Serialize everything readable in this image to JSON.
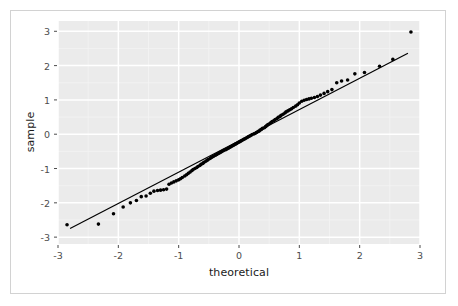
{
  "figure": {
    "width": 458,
    "height": 306,
    "background": "#ffffff",
    "frame_color": "#d2d2d2"
  },
  "chart_data": {
    "type": "scatter",
    "title": "",
    "subtitle": "",
    "xlabel": "theoretical",
    "ylabel": "sample",
    "xlim": [
      -3.0,
      3.0
    ],
    "ylim": [
      -3.2,
      3.3
    ],
    "xticks": [
      -3,
      -2,
      -1,
      0,
      1,
      2,
      3
    ],
    "xticklabels": [
      "-3",
      "-2",
      "-1",
      "0",
      "1",
      "2",
      "3"
    ],
    "yticks": [
      -3,
      -2,
      -1,
      0,
      1,
      2,
      3
    ],
    "yticklabels": [
      "-3",
      "-2",
      "-1",
      "0",
      "1",
      "2",
      "3"
    ],
    "grid": true,
    "grid_major_color": "#ffffff",
    "grid_minor_color": "#f4f4f4",
    "panel_background": "#ebebeb",
    "legend": null,
    "legend_position": "none",
    "point_color": "#000000",
    "point_size": 3.6,
    "line_color": "#000000",
    "line_width": 1.2,
    "reference_line": {
      "label": "qq reference line",
      "x": [
        -2.8,
        2.8
      ],
      "y": [
        -2.75,
        2.36
      ],
      "slope": 0.912,
      "intercept": -0.196
    },
    "series": [
      {
        "name": "sample quantiles",
        "points": [
          [
            -2.85,
            -2.64
          ],
          [
            -2.33,
            -2.62
          ],
          [
            -2.08,
            -2.32
          ],
          [
            -1.92,
            -2.12
          ],
          [
            -1.8,
            -2.0
          ],
          [
            -1.7,
            -1.93
          ],
          [
            -1.62,
            -1.82
          ],
          [
            -1.54,
            -1.8
          ],
          [
            -1.47,
            -1.72
          ],
          [
            -1.41,
            -1.66
          ],
          [
            -1.35,
            -1.64
          ],
          [
            -1.3,
            -1.63
          ],
          [
            -1.25,
            -1.62
          ],
          [
            -1.2,
            -1.6
          ],
          [
            -1.16,
            -1.46
          ],
          [
            -1.12,
            -1.42
          ],
          [
            -1.08,
            -1.39
          ],
          [
            -1.04,
            -1.36
          ],
          [
            -1.0,
            -1.33
          ],
          [
            -0.97,
            -1.3
          ],
          [
            -0.94,
            -1.26
          ],
          [
            -0.9,
            -1.22
          ],
          [
            -0.87,
            -1.18
          ],
          [
            -0.84,
            -1.14
          ],
          [
            -0.81,
            -1.1
          ],
          [
            -0.78,
            -1.06
          ],
          [
            -0.76,
            -1.03
          ],
          [
            -0.73,
            -1.0
          ],
          [
            -0.7,
            -0.97
          ],
          [
            -0.68,
            -0.94
          ],
          [
            -0.65,
            -0.91
          ],
          [
            -0.63,
            -0.88
          ],
          [
            -0.6,
            -0.85
          ],
          [
            -0.58,
            -0.82
          ],
          [
            -0.55,
            -0.79
          ],
          [
            -0.53,
            -0.76
          ],
          [
            -0.51,
            -0.74
          ],
          [
            -0.48,
            -0.71
          ],
          [
            -0.46,
            -0.68
          ],
          [
            -0.44,
            -0.66
          ],
          [
            -0.42,
            -0.64
          ],
          [
            -0.39,
            -0.61
          ],
          [
            -0.37,
            -0.59
          ],
          [
            -0.35,
            -0.57
          ],
          [
            -0.33,
            -0.55
          ],
          [
            -0.31,
            -0.53
          ],
          [
            -0.29,
            -0.51
          ],
          [
            -0.27,
            -0.49
          ],
          [
            -0.25,
            -0.47
          ],
          [
            -0.22,
            -0.45
          ],
          [
            -0.2,
            -0.43
          ],
          [
            -0.18,
            -0.41
          ],
          [
            -0.16,
            -0.39
          ],
          [
            -0.14,
            -0.37
          ],
          [
            -0.12,
            -0.35
          ],
          [
            -0.1,
            -0.33
          ],
          [
            -0.08,
            -0.31
          ],
          [
            -0.06,
            -0.29
          ],
          [
            -0.04,
            -0.27
          ],
          [
            -0.02,
            -0.25
          ],
          [
            0.0,
            -0.23
          ],
          [
            0.02,
            -0.21
          ],
          [
            0.04,
            -0.19
          ],
          [
            0.06,
            -0.17
          ],
          [
            0.08,
            -0.15
          ],
          [
            0.1,
            -0.13
          ],
          [
            0.12,
            -0.11
          ],
          [
            0.14,
            -0.09
          ],
          [
            0.16,
            -0.07
          ],
          [
            0.18,
            -0.05
          ],
          [
            0.2,
            -0.03
          ],
          [
            0.22,
            -0.01
          ],
          [
            0.25,
            0.01
          ],
          [
            0.27,
            0.03
          ],
          [
            0.29,
            0.05
          ],
          [
            0.31,
            0.07
          ],
          [
            0.33,
            0.09
          ],
          [
            0.35,
            0.12
          ],
          [
            0.37,
            0.14
          ],
          [
            0.39,
            0.17
          ],
          [
            0.42,
            0.19
          ],
          [
            0.44,
            0.22
          ],
          [
            0.46,
            0.25
          ],
          [
            0.48,
            0.28
          ],
          [
            0.51,
            0.31
          ],
          [
            0.53,
            0.34
          ],
          [
            0.55,
            0.37
          ],
          [
            0.58,
            0.4
          ],
          [
            0.6,
            0.43
          ],
          [
            0.63,
            0.46
          ],
          [
            0.65,
            0.49
          ],
          [
            0.68,
            0.52
          ],
          [
            0.7,
            0.55
          ],
          [
            0.73,
            0.58
          ],
          [
            0.76,
            0.62
          ],
          [
            0.78,
            0.65
          ],
          [
            0.81,
            0.68
          ],
          [
            0.84,
            0.71
          ],
          [
            0.87,
            0.74
          ],
          [
            0.9,
            0.78
          ],
          [
            0.94,
            0.82
          ],
          [
            0.97,
            0.86
          ],
          [
            1.0,
            0.91
          ],
          [
            1.04,
            0.96
          ],
          [
            1.08,
            0.99
          ],
          [
            1.12,
            1.01
          ],
          [
            1.16,
            1.03
          ],
          [
            1.2,
            1.05
          ],
          [
            1.25,
            1.07
          ],
          [
            1.3,
            1.1
          ],
          [
            1.35,
            1.14
          ],
          [
            1.41,
            1.19
          ],
          [
            1.47,
            1.24
          ],
          [
            1.54,
            1.3
          ],
          [
            1.62,
            1.5
          ],
          [
            1.7,
            1.55
          ],
          [
            1.8,
            1.58
          ],
          [
            1.92,
            1.76
          ],
          [
            2.08,
            1.8
          ],
          [
            2.33,
            1.98
          ],
          [
            2.55,
            2.18
          ],
          [
            2.85,
            2.98
          ]
        ]
      }
    ]
  }
}
